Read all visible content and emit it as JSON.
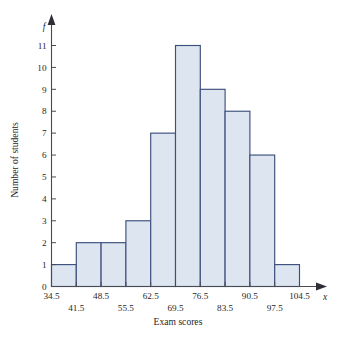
{
  "chart_data": {
    "type": "bar",
    "title": "",
    "subtitle": "",
    "xlabel": "Exam scores",
    "ylabel": "Number of students",
    "x_axis_variable": "x",
    "y_axis_variable": "f",
    "grid": false,
    "legend": false,
    "legend_position": "none",
    "bin_edges": [
      34.5,
      41.5,
      48.5,
      55.5,
      62.5,
      69.5,
      76.5,
      83.5,
      90.5,
      97.5,
      104.5
    ],
    "bin_width": 7,
    "categories": [
      "34.5-41.5",
      "41.5-48.5",
      "48.5-55.5",
      "55.5-62.5",
      "62.5-69.5",
      "69.5-76.5",
      "76.5-83.5",
      "83.5-90.5",
      "90.5-97.5",
      "97.5-104.5"
    ],
    "values": [
      1,
      2,
      2,
      3,
      7,
      11,
      9,
      8,
      6,
      1
    ],
    "total_frequency": 50,
    "xlim": [
      34.5,
      104.5
    ],
    "ylim": [
      0,
      11
    ],
    "y_tick_labels": [
      "0",
      "1",
      "2",
      "3",
      "4",
      "5",
      "6",
      "7",
      "8",
      "9",
      "10",
      "11"
    ],
    "y_tick_values": [
      0,
      1,
      2,
      3,
      4,
      5,
      6,
      7,
      8,
      9,
      10,
      11
    ],
    "x_tick_labels_upper": [
      "34.5",
      "48.5",
      "62.5",
      "76.5",
      "90.5",
      "104.5"
    ],
    "x_tick_values_upper": [
      34.5,
      48.5,
      62.5,
      76.5,
      90.5,
      104.5
    ],
    "x_tick_labels_lower": [
      "41.5",
      "55.5",
      "69.5",
      "83.5",
      "97.5"
    ],
    "x_tick_values_lower": [
      41.5,
      55.5,
      69.5,
      83.5,
      97.5
    ],
    "bar_fill_color": "#dce5f0",
    "bar_border_color": "#3d4f7c",
    "axis_color": "#4a4a55"
  }
}
